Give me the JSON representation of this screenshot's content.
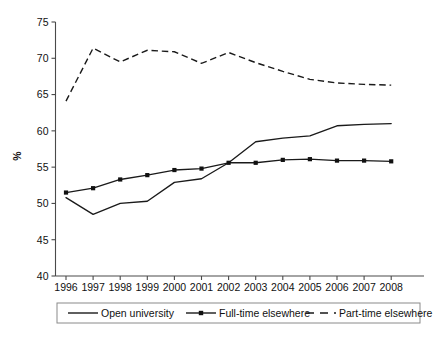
{
  "chart_data": {
    "type": "line",
    "title": "",
    "xlabel": "",
    "ylabel": "%",
    "categories": [
      "1996",
      "1997",
      "1998",
      "1999",
      "2000",
      "2001",
      "2002",
      "2003",
      "2004",
      "2005",
      "2006",
      "2007",
      "2008"
    ],
    "x": [
      1996,
      1997,
      1998,
      1999,
      2000,
      2001,
      2002,
      2003,
      2004,
      2005,
      2006,
      2007,
      2008
    ],
    "ylim": [
      40,
      75
    ],
    "yticks": [
      40,
      45,
      50,
      55,
      60,
      65,
      70,
      75
    ],
    "ytick_labels": [
      "40",
      "45",
      "50",
      "55",
      "60",
      "65",
      "70",
      "75"
    ],
    "grid": false,
    "legend_position": "below-axes",
    "series": [
      {
        "name": "Open university",
        "style": "solid",
        "marker": "none",
        "color": "#1a1a1a",
        "values": [
          50.8,
          48.5,
          50.0,
          50.3,
          52.9,
          53.4,
          55.6,
          58.5,
          59.0,
          59.3,
          60.7,
          60.9,
          61.0
        ]
      },
      {
        "name": "Full-time elsewhere",
        "style": "solid",
        "marker": "square",
        "color": "#1a1a1a",
        "values": [
          51.5,
          52.1,
          53.3,
          53.9,
          54.6,
          54.8,
          55.6,
          55.6,
          56.0,
          56.1,
          55.9,
          55.9,
          55.8
        ]
      },
      {
        "name": "Part-time elsewhere",
        "style": "dashed",
        "marker": "none",
        "color": "#1a1a1a",
        "values": [
          64.1,
          71.4,
          69.5,
          71.1,
          70.9,
          69.3,
          70.8,
          69.4,
          68.2,
          67.1,
          66.6,
          66.4,
          66.3
        ]
      }
    ]
  },
  "legend": {
    "items": [
      {
        "label": "Open university",
        "style": "solid",
        "marker": "none"
      },
      {
        "label": "Full-time elsewhere",
        "style": "solid",
        "marker": "square"
      },
      {
        "label": "Part-time elsewhere",
        "style": "dashed",
        "marker": "none"
      }
    ]
  },
  "axes": {
    "y_axis_title": "%"
  }
}
